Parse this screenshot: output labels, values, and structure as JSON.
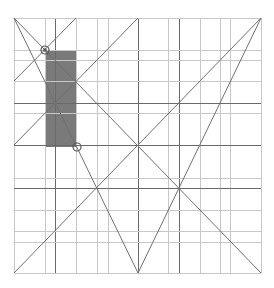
{
  "diagram": {
    "type": "geometric-construction-grid",
    "canvas": {
      "width": 274,
      "height": 288,
      "background": "#ffffff"
    },
    "frame": {
      "x1": 14,
      "y1": 18,
      "x2": 261,
      "y2": 273
    },
    "colors": {
      "grid_light": "#c8c8c8",
      "grid_dark": "#6a6a6a",
      "diagonal": "#707070",
      "highlight_fill": "#7a7a7a",
      "marker_stroke": "#555555"
    },
    "vertical_lines": [
      {
        "x": 14,
        "weight": "light"
      },
      {
        "x": 45,
        "weight": "light"
      },
      {
        "x": 55,
        "weight": "dark"
      },
      {
        "x": 76,
        "weight": "light"
      },
      {
        "x": 97,
        "weight": "light"
      },
      {
        "x": 108,
        "weight": "light"
      },
      {
        "x": 138,
        "weight": "dark"
      },
      {
        "x": 168,
        "weight": "light"
      },
      {
        "x": 179,
        "weight": "dark"
      },
      {
        "x": 200,
        "weight": "light"
      },
      {
        "x": 220,
        "weight": "light"
      },
      {
        "x": 230,
        "weight": "light"
      },
      {
        "x": 261,
        "weight": "light"
      }
    ],
    "horizontal_lines": [
      {
        "y": 18,
        "weight": "light"
      },
      {
        "y": 50,
        "weight": "light"
      },
      {
        "y": 60,
        "weight": "light"
      },
      {
        "y": 81,
        "weight": "light"
      },
      {
        "y": 103,
        "weight": "dark"
      },
      {
        "y": 113,
        "weight": "light"
      },
      {
        "y": 145,
        "weight": "dark"
      },
      {
        "y": 178,
        "weight": "light"
      },
      {
        "y": 188,
        "weight": "dark"
      },
      {
        "y": 210,
        "weight": "light"
      },
      {
        "y": 231,
        "weight": "light"
      },
      {
        "y": 242,
        "weight": "light"
      },
      {
        "y": 273,
        "weight": "light"
      }
    ],
    "diagonals": [
      {
        "name": "main-diagonal",
        "x1": 14,
        "y1": 18,
        "x2": 261,
        "y2": 273
      },
      {
        "name": "anti-diagonal",
        "x1": 14,
        "y1": 273,
        "x2": 261,
        "y2": 18
      },
      {
        "name": "upper-left-short",
        "x1": 76,
        "y1": 18,
        "x2": 14,
        "y2": 81
      },
      {
        "name": "left-mid-to-top-center",
        "x1": 14,
        "y1": 145,
        "x2": 138,
        "y2": 18
      },
      {
        "name": "top-left-to-bottom-center",
        "x1": 14,
        "y1": 18,
        "x2": 138,
        "y2": 273
      },
      {
        "name": "top-right-to-bottom-center",
        "x1": 261,
        "y1": 18,
        "x2": 138,
        "y2": 273
      }
    ],
    "highlight_rect": {
      "x": 45,
      "y": 50,
      "width": 31,
      "height": 97
    },
    "markers": [
      {
        "name": "start-marker",
        "cx": 45,
        "cy": 50,
        "r": 4,
        "filled_center": true
      },
      {
        "name": "end-marker",
        "cx": 77,
        "cy": 147,
        "r": 4,
        "filled_center": false
      }
    ]
  }
}
